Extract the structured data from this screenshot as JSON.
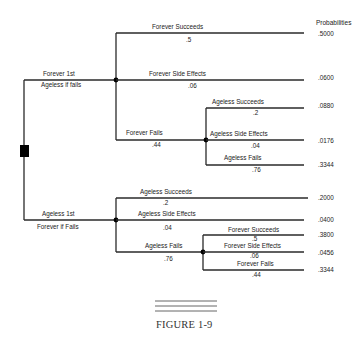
{
  "header": {
    "probabilities_label": "Probabilities"
  },
  "decision_node": {
    "shape": "square",
    "color": "#000000"
  },
  "branches": [
    {
      "label_top": "Forever 1st",
      "label_bottom": "Ageless if fails",
      "outcomes": [
        {
          "label": "Forever Succeeds",
          "prob": ".5",
          "final": ".5000"
        },
        {
          "label": "Forever Side Effects",
          "prob": ".06",
          "final": ".0600"
        },
        {
          "label": "Forever Fails",
          "prob": ".44",
          "outcomes": [
            {
              "label": "Ageless Succeeds",
              "prob": ".2",
              "final": ".0880"
            },
            {
              "label": "Ageless Side Effects",
              "prob": ".04",
              "final": ".0176"
            },
            {
              "label": "Ageless Fails",
              "prob": ".76",
              "final": ".3344"
            }
          ]
        }
      ]
    },
    {
      "label_top": "Ageless 1st",
      "label_bottom": "Forever if Fails",
      "outcomes": [
        {
          "label": "Ageless Succeeds",
          "prob": ".2",
          "final": ".2000"
        },
        {
          "label": "Ageless Side Effects",
          "prob": ".04",
          "final": ".0400"
        },
        {
          "label": "Ageless Fails",
          "prob": ".76",
          "outcomes": [
            {
              "label": "Forever Succeeds",
              "prob": ".5",
              "final": ".3800"
            },
            {
              "label": "Forever Side Effects",
              "prob": ".06",
              "final": ".0456"
            },
            {
              "label": "Forever Fails",
              "prob": ".44",
              "final": ".3344"
            }
          ]
        }
      ]
    }
  ],
  "caption": "FIGURE 1-9"
}
